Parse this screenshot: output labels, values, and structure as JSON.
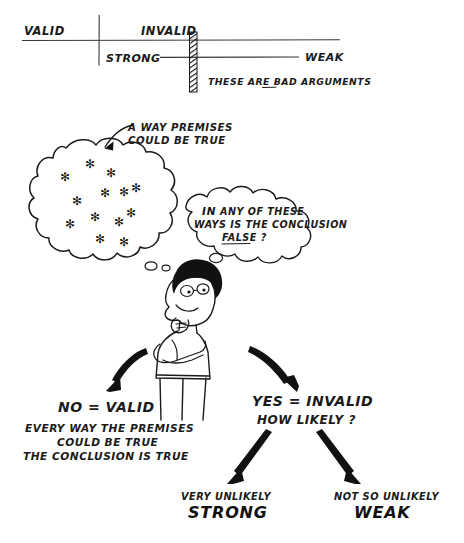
{
  "figure": {
    "background_color": "#ffffff",
    "ink_color": "#1a1a1a"
  },
  "scale": {
    "valid_label": "VALID",
    "invalid_label": "INVALID",
    "strong_label": "STRONG",
    "weak_label": "WEAK",
    "bad_arguments_note": "THESE ARE BAD ARGUMENTS",
    "bad_word_underlined": "BAD"
  },
  "cloud": {
    "callout_line1": "A WAY PREMISES",
    "callout_line2": "COULD BE TRUE",
    "star_count": 13
  },
  "thought": {
    "line1_bold": "IN",
    "line1_rest": "ANY OF THESE",
    "line2": "WAYS IS THE CONCLUSION",
    "line3_underlined": "FALSE",
    "line3_tail": "?"
  },
  "character": {
    "name": "thinking-person",
    "pose": "arms crossed, hand on chin"
  },
  "branch_no": {
    "heading": "NO = VALID",
    "detail_line1": "EVERY WAY THE PREMISES",
    "detail_line2": "COULD BE TRUE",
    "detail_line3": "THE CONCLUSION IS TRUE"
  },
  "branch_yes": {
    "heading": "YES = INVALID",
    "question": "HOW LIKELY ?"
  },
  "outcome_strong": {
    "qualifier": "VERY UNLIKELY",
    "label": "STRONG"
  },
  "outcome_weak": {
    "qualifier": "NOT SO UNLIKELY",
    "label": "WEAK"
  }
}
